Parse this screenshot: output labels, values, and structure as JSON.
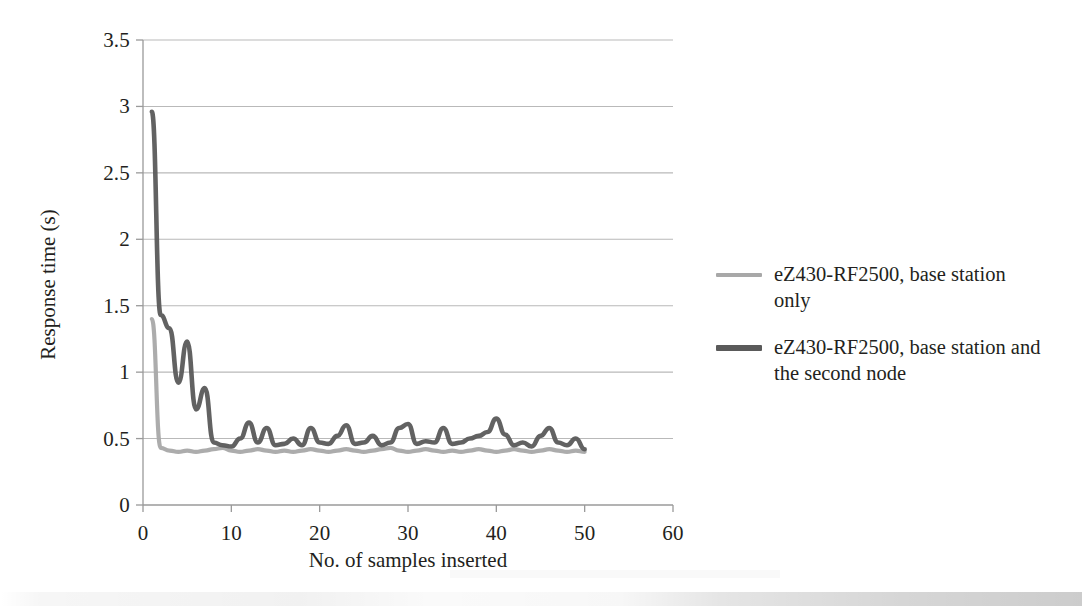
{
  "chart_data": {
    "type": "line",
    "title": "",
    "xlabel": "No. of samples inserted",
    "ylabel": "Response time (s)",
    "xlim": [
      0,
      60
    ],
    "ylim": [
      0,
      3.5
    ],
    "xticks": [
      "0",
      "10",
      "20",
      "30",
      "40",
      "50",
      "60"
    ],
    "yticks": [
      "0",
      "0.5",
      "1",
      "1.5",
      "2",
      "2.5",
      "3",
      "3.5"
    ],
    "grid": "horizontal",
    "legend_position": "right",
    "x": [
      1,
      2,
      3,
      4,
      5,
      6,
      7,
      8,
      9,
      10,
      11,
      12,
      13,
      14,
      15,
      16,
      17,
      18,
      19,
      20,
      21,
      22,
      23,
      24,
      25,
      26,
      27,
      28,
      29,
      30,
      31,
      32,
      33,
      34,
      35,
      36,
      37,
      38,
      39,
      40,
      41,
      42,
      43,
      44,
      45,
      46,
      47,
      48,
      49,
      50
    ],
    "series": [
      {
        "name": "eZ430-RF2500, base station only",
        "color": "#a8a8a8",
        "values": [
          1.4,
          0.43,
          0.41,
          0.4,
          0.41,
          0.4,
          0.41,
          0.42,
          0.43,
          0.41,
          0.4,
          0.41,
          0.42,
          0.41,
          0.4,
          0.41,
          0.4,
          0.41,
          0.42,
          0.41,
          0.4,
          0.41,
          0.42,
          0.41,
          0.4,
          0.41,
          0.42,
          0.43,
          0.41,
          0.4,
          0.41,
          0.42,
          0.41,
          0.4,
          0.41,
          0.4,
          0.41,
          0.42,
          0.41,
          0.4,
          0.41,
          0.42,
          0.41,
          0.4,
          0.41,
          0.42,
          0.41,
          0.4,
          0.41,
          0.4
        ]
      },
      {
        "name": "eZ430-RF2500, base station and the second node",
        "color": "#5a5a5a",
        "values": [
          2.96,
          1.43,
          1.33,
          0.92,
          1.23,
          0.72,
          0.88,
          0.47,
          0.45,
          0.44,
          0.5,
          0.62,
          0.47,
          0.58,
          0.45,
          0.46,
          0.5,
          0.45,
          0.58,
          0.47,
          0.46,
          0.52,
          0.6,
          0.46,
          0.47,
          0.52,
          0.45,
          0.47,
          0.58,
          0.61,
          0.46,
          0.48,
          0.47,
          0.58,
          0.46,
          0.47,
          0.5,
          0.52,
          0.55,
          0.65,
          0.53,
          0.45,
          0.47,
          0.44,
          0.52,
          0.58,
          0.47,
          0.45,
          0.5,
          0.42
        ]
      }
    ]
  },
  "axes": {
    "y_title": "Response time (s)",
    "x_title": "No. of samples inserted",
    "y_tick_labels": [
      "3.5",
      "3",
      "2.5",
      "2",
      "1.5",
      "1",
      "0.5",
      "0"
    ],
    "x_tick_labels": [
      "0",
      "10",
      "20",
      "30",
      "40",
      "50",
      "60"
    ]
  },
  "legend": {
    "items": [
      {
        "label": "eZ430-RF2500, base station only",
        "color": "#a8a8a8"
      },
      {
        "label": "eZ430-RF2500, base station and the second node",
        "color": "#5a5a5a"
      }
    ]
  },
  "colors": {
    "series_light": "#a8a8a8",
    "series_dark": "#5a5a5a",
    "gridline": "#b9b9b9",
    "axis": "#9a9a9a",
    "text": "#231f20",
    "background": "#ffffff"
  }
}
